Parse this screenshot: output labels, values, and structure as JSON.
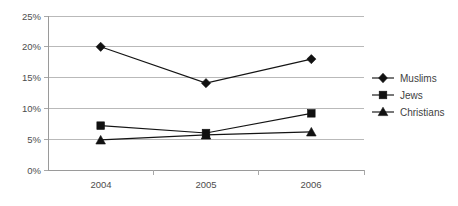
{
  "chart_data": {
    "type": "line",
    "title": "",
    "xlabel": "",
    "ylabel": "",
    "categories": [
      "2004",
      "2005",
      "2006"
    ],
    "ylim": [
      0,
      25
    ],
    "ytick_values": [
      0,
      5,
      10,
      15,
      20,
      25
    ],
    "ytick_labels": [
      "0%",
      "5%",
      "10%",
      "15%",
      "20%",
      "25%"
    ],
    "grid": true,
    "legend_position": "right",
    "value_suffix": "%",
    "series": [
      {
        "name": "Muslims",
        "marker": "diamond",
        "color": "#111111",
        "values": [
          20.0,
          14.1,
          18.0
        ]
      },
      {
        "name": "Jews",
        "marker": "square",
        "color": "#111111",
        "values": [
          7.2,
          6.0,
          9.2
        ]
      },
      {
        "name": "Christians",
        "marker": "triangle",
        "color": "#111111",
        "values": [
          4.9,
          5.7,
          6.2
        ]
      }
    ]
  },
  "legend": {
    "items": [
      {
        "label": "Muslims"
      },
      {
        "label": "Jews"
      },
      {
        "label": "Christians"
      }
    ]
  },
  "axes": {
    "y_labels": [
      "25%",
      "20%",
      "15%",
      "10%",
      "5%",
      "0%"
    ],
    "x_labels": [
      "2004",
      "2005",
      "2006"
    ]
  },
  "colors": {
    "series": "#111111",
    "gridline": "#b9b9b9",
    "axis": "#9a9a9a",
    "text": "#4d4d4d",
    "background": "#ffffff"
  }
}
